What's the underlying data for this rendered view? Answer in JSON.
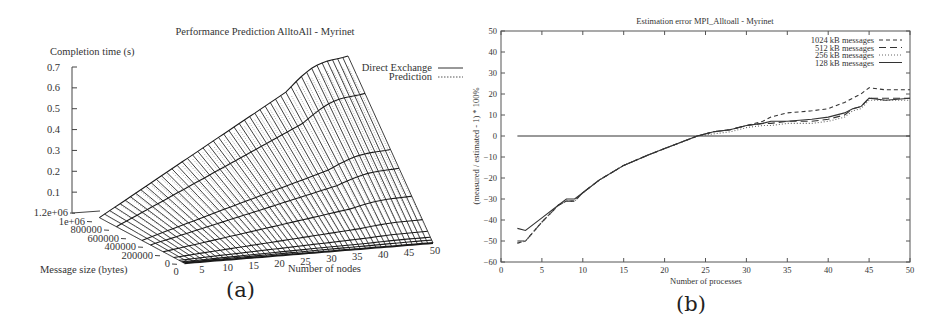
{
  "figure": {
    "panel_a_label": "(a)",
    "panel_b_label": "(b)"
  },
  "chart_data": [
    {
      "id": "a",
      "type": "surface3d",
      "title": "Performance Prediction AlltoAll - Myrinet",
      "zlabel": "Completion time (s)",
      "xlabel": "Number of nodes",
      "ylabel": "Message size (bytes)",
      "z_ticks": [
        "0.7",
        "0.6",
        "0.5",
        "0.4",
        "0.3",
        "0.2",
        "0.1"
      ],
      "z_range": [
        0,
        0.7
      ],
      "x_ticks": [
        "0",
        "5",
        "10",
        "15",
        "20",
        "25",
        "30",
        "35",
        "40",
        "45",
        "50"
      ],
      "x_range": [
        0,
        50
      ],
      "y_ticks": [
        "0",
        "200000",
        "400000",
        "600000",
        "800000",
        "1e+06",
        "1.2e+06"
      ],
      "y_range": [
        0,
        1200000
      ],
      "legend": [
        {
          "name": "Direct Exchange",
          "style": "solid"
        },
        {
          "name": "Prediction",
          "style": "dotted"
        }
      ],
      "legend_position": "top-right",
      "surface_note": "Completion time grows roughly linearly with message size and number of nodes; peak ~0.72 s at 50 nodes, 1e+06 bytes",
      "nodes": [
        2,
        10,
        20,
        30,
        40,
        50
      ],
      "max_msg_series": {
        "message_size": 1000000,
        "values": [
          0.0,
          0.14,
          0.29,
          0.43,
          0.57,
          0.72
        ]
      }
    },
    {
      "id": "b",
      "type": "line",
      "title": "Estimation error MPI_Alltoall - Myrinet",
      "xlabel": "Number of processes",
      "ylabel": "(measured / estimated - 1) * 100%",
      "xlim": [
        0,
        50
      ],
      "ylim": [
        -60,
        50
      ],
      "x_ticks": [
        "0",
        "5",
        "10",
        "15",
        "20",
        "25",
        "30",
        "35",
        "40",
        "45",
        "50"
      ],
      "y_ticks": [
        "50",
        "40",
        "30",
        "20",
        "10",
        "0",
        "-10",
        "-20",
        "-30",
        "-40",
        "-50",
        "-60"
      ],
      "grid": false,
      "legend_position": "top-right",
      "x": [
        2,
        3,
        5,
        7,
        8,
        9,
        10,
        12,
        15,
        18,
        20,
        22,
        24,
        26,
        28,
        30,
        32,
        33,
        35,
        38,
        40,
        42,
        43,
        44,
        45,
        47,
        50
      ],
      "series": [
        {
          "name": "1024 kB messages",
          "style": "dash-short",
          "values": [
            -51,
            -50,
            -41,
            -33,
            -31,
            -31,
            -27,
            -21,
            -14,
            -9,
            -6,
            -3,
            0,
            2,
            3,
            5,
            7,
            9,
            11,
            12,
            13,
            16,
            18,
            20,
            23,
            22,
            22
          ]
        },
        {
          "name": "512 kB messages",
          "style": "dash-long",
          "values": [
            -50,
            -50,
            -41,
            -33,
            -31,
            -31,
            -27,
            -21,
            -14,
            -9,
            -6,
            -3,
            0,
            2,
            3,
            5,
            6,
            6,
            7,
            7,
            8,
            10,
            13,
            14,
            18,
            18,
            18
          ]
        },
        {
          "name": "256 kB messages",
          "style": "dotted",
          "values": [
            -51,
            -50,
            -41,
            -33,
            -31,
            -31,
            -27,
            -21,
            -14,
            -9,
            -6,
            -3,
            0,
            1,
            2,
            4,
            5,
            5,
            6,
            6,
            7,
            9,
            12,
            13,
            17,
            17,
            17
          ]
        },
        {
          "name": "128 kB messages",
          "style": "solid",
          "values": [
            -44,
            -45,
            -39,
            -33,
            -30,
            -30,
            -27,
            -21,
            -14,
            -9,
            -6,
            -3,
            0,
            2,
            3,
            5,
            6,
            7,
            7,
            8,
            9,
            11,
            13,
            14,
            18,
            17,
            18
          ]
        },
        {
          "name": "zero reference",
          "style": "solid-thin",
          "x_override": [
            2,
            50
          ],
          "values": [
            0,
            0
          ]
        }
      ]
    }
  ]
}
